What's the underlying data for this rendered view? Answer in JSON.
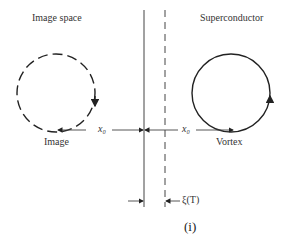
{
  "diagram": {
    "labels": {
      "left_region": "Image space",
      "right_region": "Superconductor",
      "left_circle": "Image",
      "right_circle": "Vortex",
      "distance_left": "x₀",
      "distance_right": "x₀",
      "coherence": "ξ(T)",
      "caption": "(i)"
    },
    "elements": {
      "boundary_line": "solid vertical surface line",
      "coherence_line": "dashed vertical line",
      "image_vortex": "dashed circle with clockwise arrow",
      "real_vortex": "solid circle with counterclockwise arrow"
    },
    "colors": {
      "stroke": "#222222",
      "background": "#ffffff"
    }
  }
}
